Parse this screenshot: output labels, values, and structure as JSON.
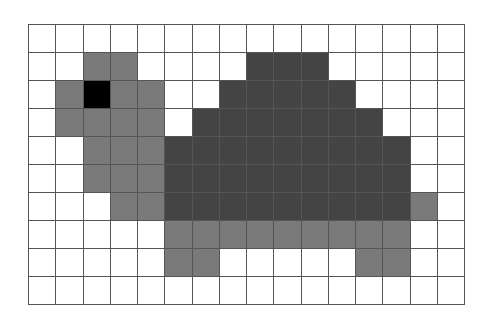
{
  "grid": {
    "columns": 16,
    "rows": 10,
    "line_color": "#555555"
  },
  "palette": {
    "0": "#ffffff",
    "1": "#7a7a7a",
    "2": "#444444",
    "3": "#000000"
  },
  "palette_names": {
    "0": "white",
    "1": "mid-gray",
    "2": "dark-gray",
    "3": "black"
  },
  "cells": [
    [
      0,
      0,
      0,
      0,
      0,
      0,
      0,
      0,
      0,
      0,
      0,
      0,
      0,
      0,
      0,
      0
    ],
    [
      0,
      0,
      1,
      1,
      0,
      0,
      0,
      0,
      2,
      2,
      2,
      0,
      0,
      0,
      0,
      0
    ],
    [
      0,
      1,
      3,
      1,
      1,
      0,
      0,
      2,
      2,
      2,
      2,
      2,
      0,
      0,
      0,
      0
    ],
    [
      0,
      1,
      1,
      1,
      1,
      0,
      2,
      2,
      2,
      2,
      2,
      2,
      2,
      0,
      0,
      0
    ],
    [
      0,
      0,
      1,
      1,
      1,
      2,
      2,
      2,
      2,
      2,
      2,
      2,
      2,
      2,
      0,
      0
    ],
    [
      0,
      0,
      1,
      1,
      1,
      2,
      2,
      2,
      2,
      2,
      2,
      2,
      2,
      2,
      0,
      0
    ],
    [
      0,
      0,
      0,
      1,
      1,
      2,
      2,
      2,
      2,
      2,
      2,
      2,
      2,
      2,
      1,
      0
    ],
    [
      0,
      0,
      0,
      0,
      0,
      1,
      1,
      1,
      1,
      1,
      1,
      1,
      1,
      1,
      0,
      0
    ],
    [
      0,
      0,
      0,
      0,
      0,
      1,
      1,
      0,
      0,
      0,
      0,
      0,
      1,
      1,
      0,
      0
    ],
    [
      0,
      0,
      0,
      0,
      0,
      0,
      0,
      0,
      0,
      0,
      0,
      0,
      0,
      0,
      0,
      0
    ]
  ]
}
